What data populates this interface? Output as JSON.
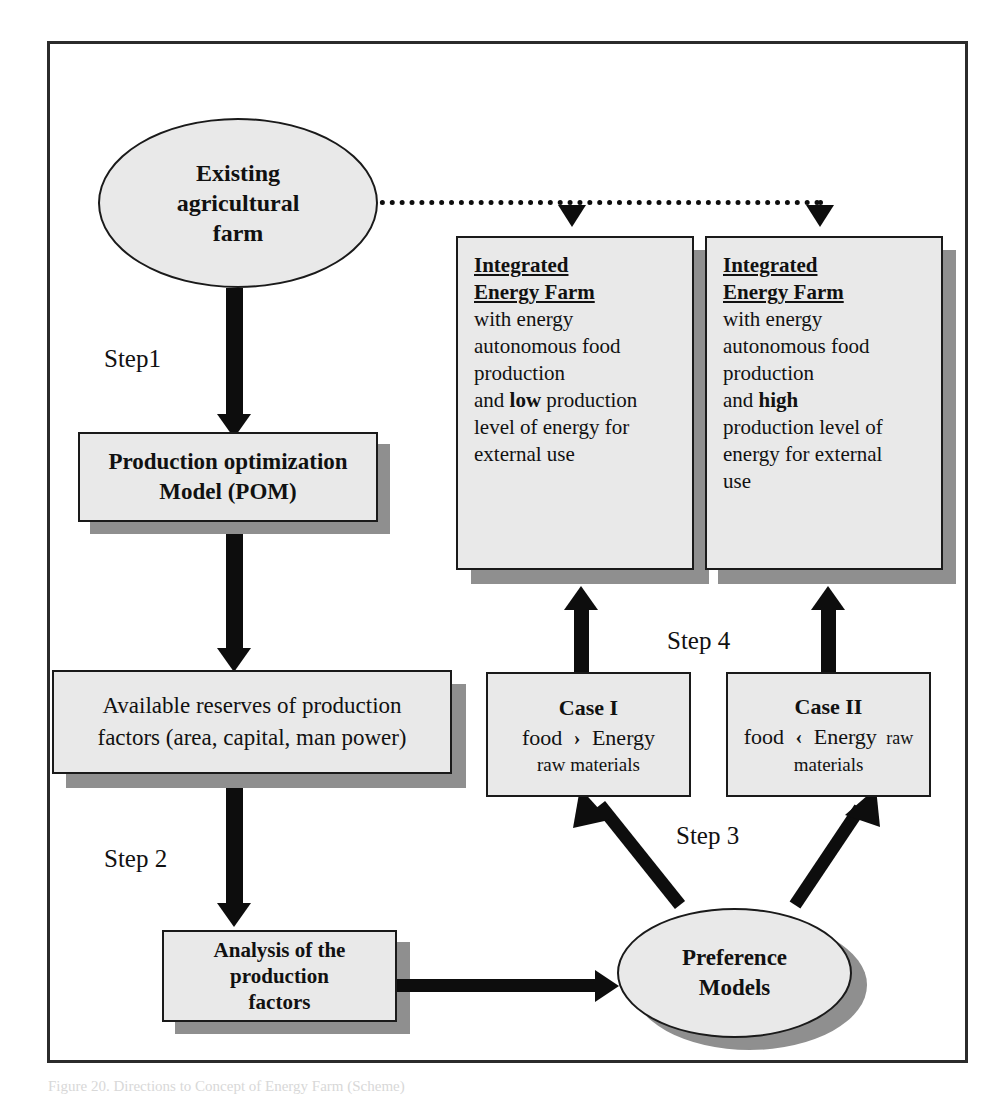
{
  "figure": {
    "caption": "Figure 20.  Directions to Concept of Energy Farm (Scheme)"
  },
  "nodes": {
    "existing_farm": {
      "type": "ellipse",
      "lines": [
        "Existing",
        "agricultural",
        "farm"
      ]
    },
    "pom": {
      "type": "box",
      "lines": [
        "Production optimization",
        "Model (POM)"
      ]
    },
    "reserves": {
      "type": "box",
      "lines": [
        "Available reserves of production",
        "factors (area, capital, man power)"
      ]
    },
    "analysis": {
      "type": "box",
      "lines": [
        "Analysis of the",
        "production",
        "factors"
      ]
    },
    "preference_models": {
      "type": "ellipse",
      "lines": [
        "Preference",
        "Models"
      ]
    },
    "case_1": {
      "type": "box",
      "title": "Case I",
      "line2_a": "food",
      "line2_op": "›",
      "line2_b": "Energy",
      "line3": "raw materials"
    },
    "case_2": {
      "type": "box",
      "title": "Case II",
      "line2_a": "food",
      "line2_op": "‹",
      "line2_b": "Energy",
      "line2_c": "raw",
      "line3": "materials"
    },
    "ief_low": {
      "type": "box",
      "title_l1": "Integrated",
      "title_l2": "Energy Farm",
      "body": [
        {
          "text": "with energy"
        },
        {
          "text": "autonomous food"
        },
        {
          "text": "production"
        },
        {
          "pre": "and ",
          "strong": "low",
          "post": " production"
        },
        {
          "text": "level of energy for"
        },
        {
          "text": "external use"
        }
      ]
    },
    "ief_high": {
      "type": "box",
      "title_l1": "Integrated",
      "title_l2": "Energy Farm",
      "body": [
        {
          "text": "with energy"
        },
        {
          "text": "autonomous food"
        },
        {
          "text": "production"
        },
        {
          "pre": "and ",
          "strong": "high",
          "post": ""
        },
        {
          "text": "production level of"
        },
        {
          "text": "energy for external"
        },
        {
          "text": "use"
        }
      ]
    }
  },
  "steps": {
    "step1": "Step1",
    "step2": "Step 2",
    "step3": "Step 3",
    "step4": "Step 4"
  },
  "colors": {
    "node_fill": "#e9e9e9",
    "node_stroke": "#1a1a1a",
    "shadow": "#8f8f8f",
    "arrow": "#0d0d0d",
    "frame": "#2b2b2b",
    "page": "#ffffff"
  }
}
